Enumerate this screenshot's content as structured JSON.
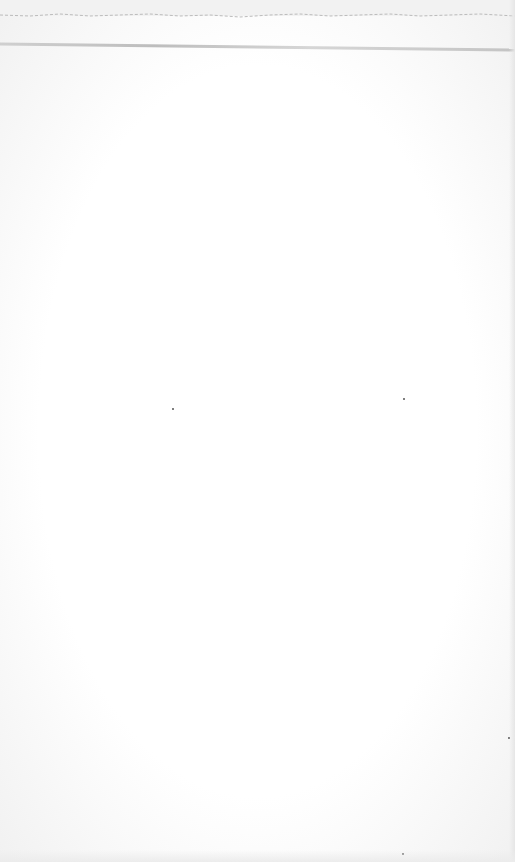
{
  "scene": {
    "subject": "blank sheet of paper",
    "colors": {
      "paper": "#fdfdfd",
      "shadow": "#c8c8c8",
      "torn_edge": "#b8b8b8"
    }
  }
}
